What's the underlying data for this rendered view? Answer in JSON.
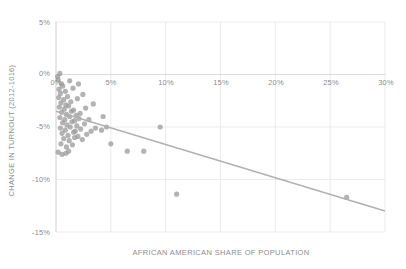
{
  "chart_data": {
    "type": "scatter",
    "title": "",
    "xlabel": "AFRICAN AMERICAN SHARE OF POPULATION",
    "ylabel": "CHANGE IN TURNOUT (2012-1016)",
    "xlim": [
      0,
      30
    ],
    "ylim": [
      -15,
      5
    ],
    "xticks": [
      0,
      5,
      10,
      15,
      20,
      25,
      30
    ],
    "xticklabels": [
      "0%",
      "5%",
      "10%",
      "15%",
      "20%",
      "25%",
      "30%"
    ],
    "yticks": [
      5,
      0,
      -5,
      -10,
      -15
    ],
    "yticklabels": [
      "5%",
      "0%",
      "-5%",
      "-10%",
      "-15%"
    ],
    "grid": true,
    "legend": "none",
    "point_color": "#9a9a9a",
    "trendline_color": "#b0b0b0",
    "grid_color": "#e6e6ea",
    "axis_text_color": "#8d8d8d",
    "background": "#ffffff",
    "series": [
      {
        "name": "counties",
        "points": [
          [
            0.15,
            -0.2
          ],
          [
            0.35,
            0.1
          ],
          [
            0.2,
            -0.5
          ],
          [
            0.5,
            -0.9
          ],
          [
            0.28,
            -1.4
          ],
          [
            0.62,
            -1.1
          ],
          [
            0.4,
            -1.8
          ],
          [
            0.85,
            -1.6
          ],
          [
            0.25,
            -2.2
          ],
          [
            0.7,
            -2.4
          ],
          [
            1.05,
            -2.1
          ],
          [
            0.45,
            -2.7
          ],
          [
            0.9,
            -2.9
          ],
          [
            1.35,
            -2.6
          ],
          [
            0.3,
            -3.1
          ],
          [
            0.75,
            -3.3
          ],
          [
            1.15,
            -3.0
          ],
          [
            1.6,
            -3.4
          ],
          [
            0.5,
            -3.6
          ],
          [
            0.95,
            -3.8
          ],
          [
            1.4,
            -3.5
          ],
          [
            1.85,
            -3.9
          ],
          [
            0.35,
            -4.1
          ],
          [
            0.8,
            -4.3
          ],
          [
            1.25,
            -4.0
          ],
          [
            1.7,
            -4.4
          ],
          [
            2.1,
            -4.2
          ],
          [
            0.6,
            -4.6
          ],
          [
            1.0,
            -4.8
          ],
          [
            1.45,
            -4.5
          ],
          [
            1.9,
            -4.9
          ],
          [
            0.4,
            -5.1
          ],
          [
            0.85,
            -5.3
          ],
          [
            1.3,
            -5.0
          ],
          [
            1.75,
            -5.4
          ],
          [
            2.25,
            -5.2
          ],
          [
            0.55,
            -5.6
          ],
          [
            1.1,
            -5.8
          ],
          [
            1.6,
            -5.5
          ],
          [
            2.0,
            -5.9
          ],
          [
            0.7,
            -6.1
          ],
          [
            1.2,
            -6.3
          ],
          [
            1.7,
            -6.0
          ],
          [
            2.4,
            -6.2
          ],
          [
            0.45,
            -6.6
          ],
          [
            0.95,
            -6.9
          ],
          [
            1.5,
            -6.7
          ],
          [
            2.8,
            -5.7
          ],
          [
            3.2,
            -5.4
          ],
          [
            3.6,
            -5.1
          ],
          [
            2.6,
            -4.7
          ],
          [
            3.0,
            -4.3
          ],
          [
            2.2,
            -3.7
          ],
          [
            2.7,
            -3.2
          ],
          [
            3.4,
            -2.8
          ],
          [
            1.95,
            -2.3
          ],
          [
            2.45,
            -1.9
          ],
          [
            1.55,
            -1.3
          ],
          [
            2.05,
            -0.9
          ],
          [
            1.25,
            -0.6
          ],
          [
            0.2,
            -7.4
          ],
          [
            0.55,
            -7.6
          ],
          [
            0.9,
            -7.5
          ],
          [
            1.15,
            -7.3
          ],
          [
            4.15,
            -5.3
          ],
          [
            4.6,
            -5.0
          ],
          [
            4.3,
            -4.0
          ],
          [
            5.0,
            -6.6
          ],
          [
            6.5,
            -7.3
          ],
          [
            8.0,
            -7.3
          ],
          [
            11.0,
            -11.4
          ],
          [
            26.5,
            -11.7
          ],
          [
            9.5,
            -5.0
          ]
        ]
      }
    ],
    "trendline": {
      "x0": 0.0,
      "y0": -3.5,
      "x1": 30.0,
      "y1": -13.0
    }
  }
}
